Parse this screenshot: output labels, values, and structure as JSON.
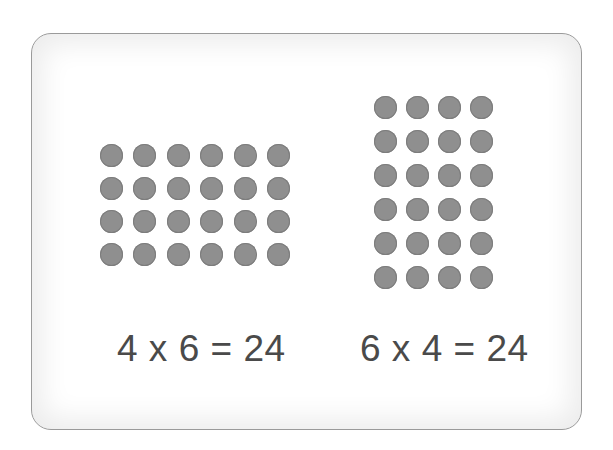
{
  "colors": {
    "dot": "#8f8f8f",
    "text": "#4a4a4a",
    "card_border": "#9a9a9a",
    "background": "#ffffff"
  },
  "arrays": [
    {
      "id": "left",
      "rows": 4,
      "columns": 6,
      "total": 24,
      "equation": "4 x 6 = 24"
    },
    {
      "id": "right",
      "rows": 6,
      "columns": 4,
      "total": 24,
      "equation": "6 x 4 = 24"
    }
  ]
}
